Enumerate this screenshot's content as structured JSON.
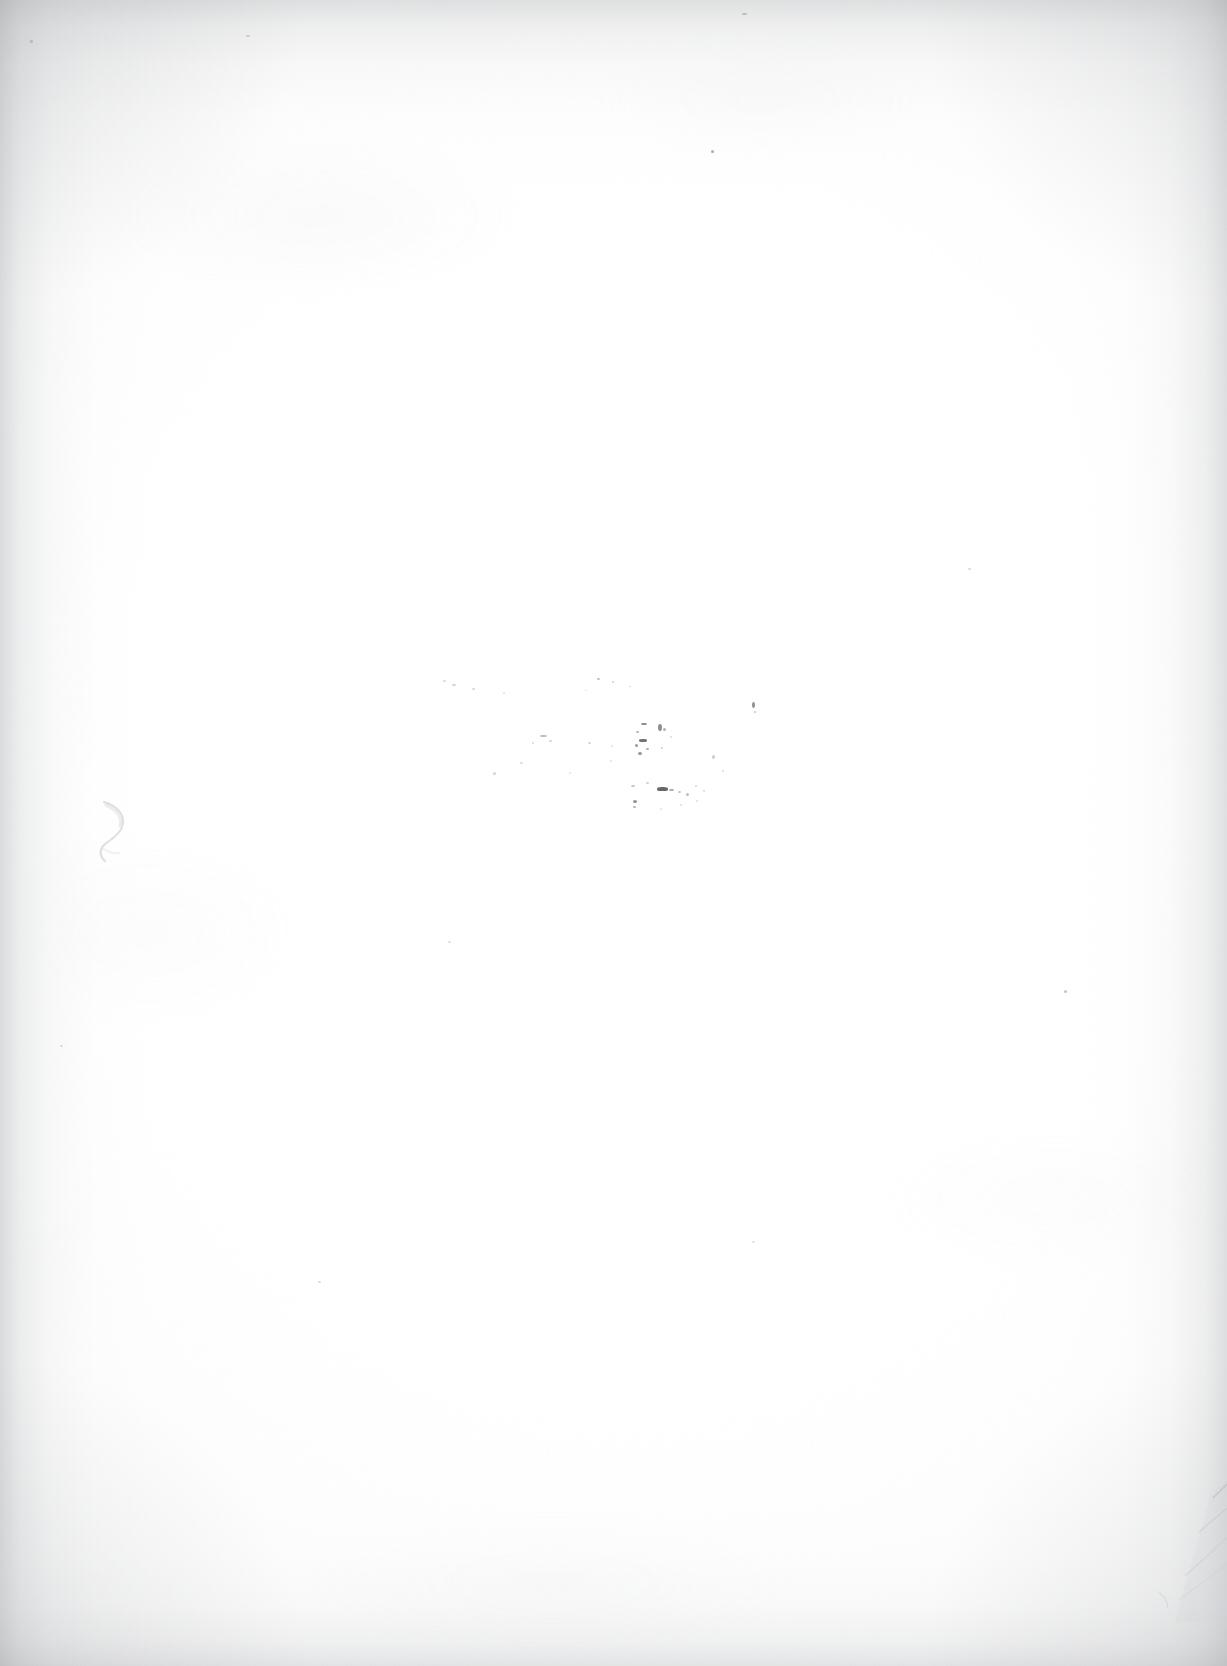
{
  "document": {
    "kind": "scanned-page",
    "page_content_text": "",
    "page_number_label": "",
    "header_text": "",
    "footer_text": "",
    "description": "Blank scanned book page with no printed text"
  },
  "canvas": {
    "width": 1227,
    "height": 1666,
    "paper_color": "#ffffff",
    "ink_color": "#3c3c3c",
    "vignette_color": "#96999c"
  },
  "artifacts": {
    "speck_cluster": {
      "name": "central-ink-speck-cluster",
      "specks": [
        {
          "x": 597,
          "y": 678,
          "w": 3,
          "h": 2,
          "o": 0.32
        },
        {
          "x": 612,
          "y": 681,
          "w": 2,
          "h": 2,
          "o": 0.26
        },
        {
          "x": 629,
          "y": 686,
          "w": 2,
          "h": 1,
          "o": 0.22
        },
        {
          "x": 585,
          "y": 690,
          "w": 2,
          "h": 1,
          "o": 0.18
        },
        {
          "x": 641,
          "y": 723,
          "w": 6,
          "h": 2,
          "o": 0.6
        },
        {
          "x": 636,
          "y": 731,
          "w": 3,
          "h": 2,
          "o": 0.4
        },
        {
          "x": 639,
          "y": 739,
          "w": 8,
          "h": 3,
          "o": 0.72
        },
        {
          "x": 635,
          "y": 744,
          "w": 3,
          "h": 3,
          "o": 0.52
        },
        {
          "x": 646,
          "y": 748,
          "w": 3,
          "h": 2,
          "o": 0.44
        },
        {
          "x": 638,
          "y": 752,
          "w": 4,
          "h": 3,
          "o": 0.55
        },
        {
          "x": 658,
          "y": 724,
          "w": 4,
          "h": 7,
          "o": 0.58
        },
        {
          "x": 663,
          "y": 728,
          "w": 3,
          "h": 3,
          "o": 0.4
        },
        {
          "x": 661,
          "y": 747,
          "w": 2,
          "h": 2,
          "o": 0.25
        },
        {
          "x": 670,
          "y": 736,
          "w": 2,
          "h": 2,
          "o": 0.2
        },
        {
          "x": 752,
          "y": 702,
          "w": 3,
          "h": 6,
          "o": 0.55
        },
        {
          "x": 754,
          "y": 711,
          "w": 2,
          "h": 2,
          "o": 0.3
        },
        {
          "x": 540,
          "y": 735,
          "w": 7,
          "h": 2,
          "o": 0.34
        },
        {
          "x": 549,
          "y": 740,
          "w": 3,
          "h": 2,
          "o": 0.24
        },
        {
          "x": 532,
          "y": 742,
          "w": 2,
          "h": 2,
          "o": 0.2
        },
        {
          "x": 588,
          "y": 742,
          "w": 3,
          "h": 2,
          "o": 0.22
        },
        {
          "x": 611,
          "y": 745,
          "w": 2,
          "h": 2,
          "o": 0.18
        },
        {
          "x": 631,
          "y": 785,
          "w": 4,
          "h": 2,
          "o": 0.3
        },
        {
          "x": 646,
          "y": 782,
          "w": 3,
          "h": 2,
          "o": 0.26
        },
        {
          "x": 657,
          "y": 787,
          "w": 11,
          "h": 4,
          "o": 0.78
        },
        {
          "x": 669,
          "y": 789,
          "w": 5,
          "h": 2,
          "o": 0.42
        },
        {
          "x": 678,
          "y": 791,
          "w": 3,
          "h": 2,
          "o": 0.3
        },
        {
          "x": 686,
          "y": 793,
          "w": 3,
          "h": 3,
          "o": 0.34
        },
        {
          "x": 633,
          "y": 800,
          "w": 4,
          "h": 3,
          "o": 0.56
        },
        {
          "x": 633,
          "y": 806,
          "w": 3,
          "h": 2,
          "o": 0.4
        },
        {
          "x": 695,
          "y": 785,
          "w": 2,
          "h": 2,
          "o": 0.22
        },
        {
          "x": 703,
          "y": 790,
          "w": 2,
          "h": 2,
          "o": 0.2
        },
        {
          "x": 696,
          "y": 800,
          "w": 2,
          "h": 2,
          "o": 0.18
        },
        {
          "x": 680,
          "y": 804,
          "w": 2,
          "h": 2,
          "o": 0.18
        },
        {
          "x": 660,
          "y": 808,
          "w": 2,
          "h": 2,
          "o": 0.16
        },
        {
          "x": 712,
          "y": 755,
          "w": 3,
          "h": 4,
          "o": 0.26
        },
        {
          "x": 722,
          "y": 770,
          "w": 2,
          "h": 2,
          "o": 0.2
        },
        {
          "x": 610,
          "y": 760,
          "w": 2,
          "h": 2,
          "o": 0.16
        },
        {
          "x": 569,
          "y": 772,
          "w": 2,
          "h": 2,
          "o": 0.16
        },
        {
          "x": 520,
          "y": 762,
          "w": 3,
          "h": 2,
          "o": 0.18
        },
        {
          "x": 493,
          "y": 772,
          "w": 3,
          "h": 3,
          "o": 0.22
        },
        {
          "x": 472,
          "y": 688,
          "w": 3,
          "h": 2,
          "o": 0.22
        },
        {
          "x": 452,
          "y": 684,
          "w": 4,
          "h": 2,
          "o": 0.24
        },
        {
          "x": 443,
          "y": 680,
          "w": 3,
          "h": 2,
          "o": 0.2
        },
        {
          "x": 503,
          "y": 692,
          "w": 2,
          "h": 2,
          "o": 0.16
        },
        {
          "x": 711,
          "y": 150,
          "w": 3,
          "h": 3,
          "o": 0.42
        },
        {
          "x": 742,
          "y": 13,
          "w": 5,
          "h": 2,
          "o": 0.26
        },
        {
          "x": 246,
          "y": 35,
          "w": 4,
          "h": 2,
          "o": 0.2
        },
        {
          "x": 1064,
          "y": 990,
          "w": 3,
          "h": 3,
          "o": 0.3
        },
        {
          "x": 968,
          "y": 568,
          "w": 3,
          "h": 2,
          "o": 0.2
        },
        {
          "x": 448,
          "y": 941,
          "w": 3,
          "h": 2,
          "o": 0.18
        },
        {
          "x": 318,
          "y": 1281,
          "w": 3,
          "h": 2,
          "o": 0.18
        },
        {
          "x": 752,
          "y": 1241,
          "w": 3,
          "h": 2,
          "o": 0.16
        },
        {
          "x": 30,
          "y": 40,
          "w": 3,
          "h": 3,
          "o": 0.22
        },
        {
          "x": 60,
          "y": 1045,
          "w": 3,
          "h": 2,
          "o": 0.18
        }
      ]
    },
    "pencil_mark": {
      "name": "faint-pencil-curve",
      "x": 92,
      "y": 796,
      "width": 56,
      "height": 70,
      "opacity": 0.85
    },
    "corner_crease": {
      "name": "bottom-right-corner-crease",
      "x": 1141,
      "y": 1472,
      "width": 86,
      "height": 150,
      "opacity": 0.9
    },
    "vignette": {
      "top_height": 190,
      "left_width": 150,
      "right_width": 160,
      "bottom_height": 170
    }
  }
}
